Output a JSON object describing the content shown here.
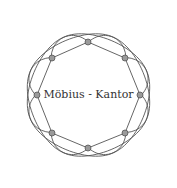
{
  "diagram": {
    "title": "Möbius - Kantor",
    "center": [
      88.5,
      95
    ],
    "node_radius_ring": 53,
    "node_count": 8,
    "nodes": [
      {
        "id": 0,
        "x": 88,
        "y": 42
      },
      {
        "id": 1,
        "x": 125,
        "y": 58
      },
      {
        "id": 2,
        "x": 140,
        "y": 95
      },
      {
        "id": 3,
        "x": 125,
        "y": 133
      },
      {
        "id": 4,
        "x": 88,
        "y": 148
      },
      {
        "id": 5,
        "x": 52,
        "y": 133
      },
      {
        "id": 6,
        "x": 37,
        "y": 95
      },
      {
        "id": 7,
        "x": 52,
        "y": 58
      }
    ],
    "colors": {
      "edge": "#555555",
      "node_fill": "#9a9a9a",
      "node_stroke": "#555555",
      "label": "#333333"
    }
  }
}
